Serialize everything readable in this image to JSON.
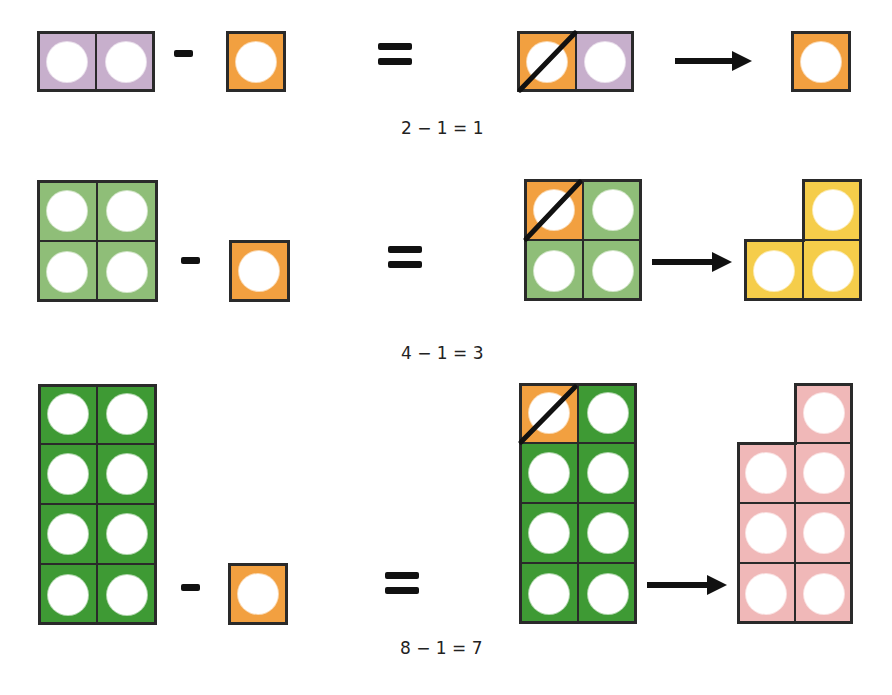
{
  "colors": {
    "purple": "#c7afcc",
    "orange": "#f2a040",
    "light_green": "#8fbe78",
    "dark_green": "#3e9a34",
    "yellow": "#f5cd4a",
    "pink": "#f0b8b8",
    "outline": "#2a2a2a",
    "hole": "#ffffff"
  },
  "rows": [
    {
      "equation": "2 − 1 = 1",
      "minuend": {
        "count": 2,
        "color": "purple",
        "layout": "1x2"
      },
      "subtrahend": {
        "count": 1,
        "color": "orange"
      },
      "result": {
        "count": 1,
        "color": "orange"
      }
    },
    {
      "equation": "4 − 1 = 3",
      "minuend": {
        "count": 4,
        "color": "light_green",
        "layout": "2x2"
      },
      "subtrahend": {
        "count": 1,
        "color": "orange"
      },
      "result": {
        "count": 3,
        "color": "yellow",
        "layout": "L-shape"
      }
    },
    {
      "equation": "8 − 1 = 7",
      "minuend": {
        "count": 8,
        "color": "dark_green",
        "layout": "4x2"
      },
      "subtrahend": {
        "count": 1,
        "color": "orange"
      },
      "result": {
        "count": 7,
        "color": "pink",
        "layout": "4x2 minus top-left"
      }
    }
  ],
  "symbols": {
    "minus": "-",
    "equals": "=",
    "arrow": "→"
  }
}
